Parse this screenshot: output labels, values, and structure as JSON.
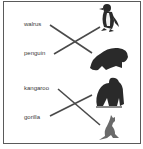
{
  "worksheet": {
    "words": [
      {
        "label": "walrus"
      },
      {
        "label": "penguin"
      },
      {
        "label": "kangaroo"
      },
      {
        "label": "gorilla"
      }
    ],
    "pictures": [
      {
        "animal": "penguin",
        "icon": "penguin-icon"
      },
      {
        "animal": "walrus",
        "icon": "walrus-icon"
      },
      {
        "animal": "gorilla",
        "icon": "gorilla-icon"
      },
      {
        "animal": "kangaroo",
        "icon": "kangaroo-icon"
      }
    ],
    "matches": [
      {
        "word": "walrus",
        "picture": "walrus"
      },
      {
        "word": "penguin",
        "picture": "penguin"
      },
      {
        "word": "kangaroo",
        "picture": "kangaroo"
      },
      {
        "word": "gorilla",
        "picture": "gorilla"
      }
    ],
    "colors": {
      "line": "#4a4a4a",
      "silhouette": "#2a2a2a",
      "border": "#5a5a5a"
    }
  }
}
